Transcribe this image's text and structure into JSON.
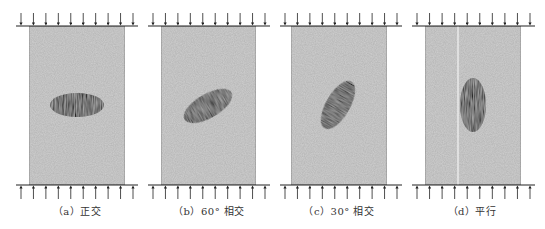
{
  "figure": {
    "colors": {
      "specimen_fill": "#cfcfcf",
      "specimen_border": "#8a8a8a",
      "inclusion_fill": "#2b2b2b",
      "arrow_color": "#222222",
      "plate_color": "#222222"
    },
    "arrow_count_per_side": 10,
    "panels": [
      {
        "id": "a",
        "caption": "（a）正交",
        "inclusion_angle_deg": 0,
        "cx": 77,
        "plate_x1": 16,
        "plate_x2": 138,
        "rect_x": 29,
        "rect_w": 96,
        "ellipse_cx": 77,
        "ellipse_cy": 105,
        "rx": 27,
        "ry": 12,
        "rotate": 0
      },
      {
        "id": "b",
        "caption": "（b）60° 相交",
        "inclusion_angle_deg": 60,
        "cx": 209,
        "plate_x1": 148,
        "plate_x2": 270,
        "rect_x": 161,
        "rect_w": 95,
        "ellipse_cx": 208,
        "ellipse_cy": 106,
        "rx": 27,
        "ry": 12,
        "rotate": -30
      },
      {
        "id": "c",
        "caption": "（c）30° 相交",
        "inclusion_angle_deg": 30,
        "cx": 339,
        "plate_x1": 280,
        "plate_x2": 402,
        "rect_x": 291,
        "rect_w": 96,
        "ellipse_cx": 338,
        "ellipse_cy": 105,
        "rx": 27,
        "ry": 12,
        "rotate": -60
      },
      {
        "id": "d",
        "caption": "（d）平行",
        "inclusion_angle_deg": 90,
        "cx": 472,
        "plate_x1": 412,
        "plate_x2": 535,
        "rect_x": 425,
        "rect_w": 96,
        "ellipse_cx": 473,
        "ellipse_cy": 105,
        "rx": 13,
        "ry": 27,
        "rotate": 0,
        "has_white_line": true,
        "white_line_x": 458
      }
    ]
  }
}
